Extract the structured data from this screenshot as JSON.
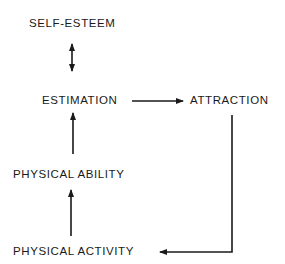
{
  "diagram": {
    "nodes": [
      {
        "id": "self_esteem",
        "label": "SELF-ESTEEM"
      },
      {
        "id": "estimation",
        "label": "ESTIMATION"
      },
      {
        "id": "attraction",
        "label": "ATTRACTION"
      },
      {
        "id": "physical_ability",
        "label": "PHYSICAL ABILITY"
      },
      {
        "id": "physical_activity",
        "label": "PHYSICAL ACTIVITY"
      }
    ],
    "edges": [
      {
        "from": "self_esteem",
        "to": "estimation",
        "type": "bidirectional"
      },
      {
        "from": "estimation",
        "to": "attraction",
        "type": "directed"
      },
      {
        "from": "physical_ability",
        "to": "estimation",
        "type": "directed"
      },
      {
        "from": "physical_activity",
        "to": "physical_ability",
        "type": "directed"
      },
      {
        "from": "attraction",
        "to": "physical_activity",
        "type": "directed"
      }
    ],
    "colors": {
      "line": "#1a1a1a",
      "background": "#ffffff"
    }
  }
}
